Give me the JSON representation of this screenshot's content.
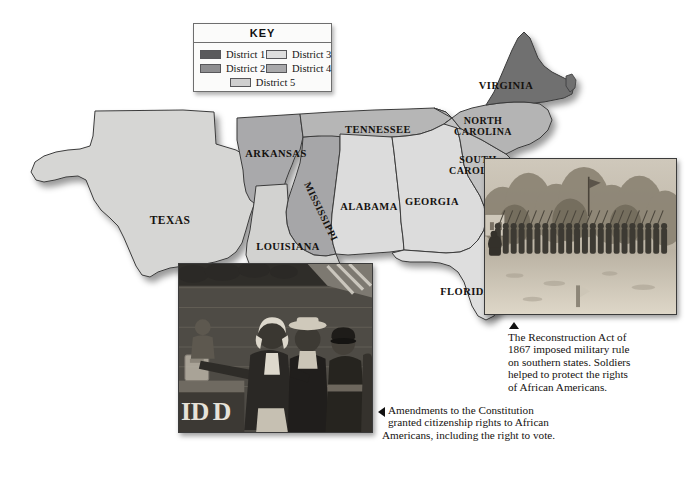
{
  "figure": {
    "kind": "historical-map"
  },
  "legend": {
    "title": "KEY",
    "entries": [
      {
        "label": "District 1",
        "color": "#5a5a5c"
      },
      {
        "label": "District 2",
        "color": "#8e8e90"
      },
      {
        "label": "District 3",
        "color": "#dedede"
      },
      {
        "label": "District 4",
        "color": "#a9a9ab"
      },
      {
        "label": "District 5",
        "color": "#cfcfcf"
      }
    ]
  },
  "map": {
    "states": [
      {
        "name": "TEXAS",
        "district": 5,
        "color": "#d6d6d4",
        "x": 170,
        "y": 224,
        "size": 11.5
      },
      {
        "name": "ARKANSAS",
        "district": 4,
        "color": "#a9a9ab",
        "x": 276,
        "y": 157,
        "size": 10.5
      },
      {
        "name": "LOUISIANA",
        "district": 5,
        "color": "#d2d2d0",
        "x": 288,
        "y": 250,
        "size": 10.5
      },
      {
        "name": "MISSISSIPPI",
        "district": 4,
        "color": "#a6a6a8",
        "x": 318,
        "y": 213,
        "size": 10.0
      },
      {
        "name": "TENNESSEE",
        "district": 2,
        "color": "#b6b6b6",
        "x": 378,
        "y": 133,
        "size": 10.5
      },
      {
        "name": "ALABAMA",
        "district": 3,
        "color": "#dcdcdc",
        "x": 369,
        "y": 208,
        "size": 10.5
      },
      {
        "name": "GEORGIA",
        "district": 3,
        "color": "#dcdcdc",
        "x": 432,
        "y": 204,
        "size": 10.5
      },
      {
        "name": "FLORIDA",
        "district": 3,
        "color": "#dedede",
        "x": 466,
        "y": 294,
        "size": 10.5
      },
      {
        "name": "SOUTH CAROLINA",
        "district": 2,
        "color": "#c2c2c2",
        "x": 478,
        "y": 163,
        "size": 10.0
      },
      {
        "name": "NORTH CAROLINA",
        "district": 2,
        "color": "#b4b4b4",
        "x": 481,
        "y": 124,
        "size": 10.0
      },
      {
        "name": "VIRGINIA",
        "district": 1,
        "color": "#6f6f70",
        "x": 504,
        "y": 88,
        "size": 10.5
      }
    ]
  },
  "insets": [
    {
      "id": "soldiers",
      "name": "union-soldiers-photograph",
      "alt": "Black and white photograph of a long line of Union soldiers standing in formation with rifles shouldered, trees behind them and an open field in front."
    },
    {
      "id": "voting",
      "name": "african-american-voting-engraving",
      "alt": "Engraving of African American men casting ballots at a polling place, an older man at a ballot box with a line of men waiting behind him and a flag overhead."
    }
  ],
  "captions": {
    "soldiers": {
      "arrow": "up",
      "lines": [
        "The Reconstruction Act of",
        "1867 imposed military rule",
        "on southern states. Soldiers",
        "helped to protect the rights",
        "of African Americans."
      ]
    },
    "voting": {
      "arrow": "left",
      "lines": [
        "Amendments to the Constitution",
        "granted citizenship rights to African",
        "Americans, including the right to vote."
      ]
    }
  }
}
